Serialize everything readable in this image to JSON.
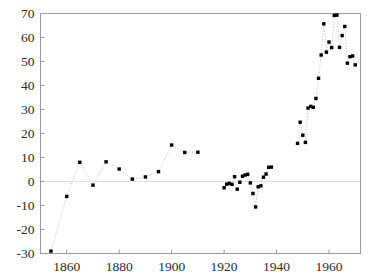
{
  "chart_data": {
    "type": "scatter",
    "title": "",
    "subtitle": "",
    "xlabel": "",
    "ylabel": "",
    "xlim": [
      1850,
      1972
    ],
    "ylim": [
      -30,
      70
    ],
    "xticks": [
      1860,
      1880,
      1900,
      1920,
      1940,
      1960
    ],
    "xtick_labels": [
      "1860",
      "1880",
      "1900",
      "1920",
      "1940",
      "1960"
    ],
    "yticks": [
      -30,
      -20,
      -10,
      0,
      10,
      20,
      30,
      40,
      50,
      60,
      70
    ],
    "ytick_labels": [
      "-30",
      "-20",
      "-10",
      "0",
      "10",
      "20",
      "30",
      "40",
      "50",
      "60",
      "70"
    ],
    "grid": false,
    "zero_line": true,
    "legend": "none",
    "marker": "square",
    "marker_color": "#000000",
    "line_color": "#b9b9b9",
    "line_style": "dotted",
    "frame_color": "#9a9a9a",
    "background": "#ffffff",
    "segments": [
      {
        "name": "segment-1854-1910",
        "points": [
          [
            1854,
            -29.0
          ],
          [
            1860,
            -6.2
          ],
          [
            1865,
            8.0
          ],
          [
            1870,
            -1.5
          ],
          [
            1875,
            8.2
          ],
          [
            1880,
            5.2
          ],
          [
            1885,
            1.0
          ],
          [
            1890,
            1.9
          ],
          [
            1895,
            4.1
          ],
          [
            1900,
            15.2
          ],
          [
            1905,
            12.1
          ],
          [
            1910,
            12.2
          ]
        ]
      },
      {
        "name": "segment-1920-1938",
        "points": [
          [
            1920,
            -2.6
          ],
          [
            1921,
            -1.1
          ],
          [
            1922,
            -0.8
          ],
          [
            1923,
            -1.2
          ],
          [
            1924,
            2.0
          ],
          [
            1925,
            -3.2
          ],
          [
            1926,
            -0.3
          ],
          [
            1927,
            2.2
          ],
          [
            1928,
            2.7
          ],
          [
            1929,
            3.0
          ],
          [
            1930,
            -0.6
          ],
          [
            1931,
            -5.0
          ],
          [
            1932,
            -10.6
          ],
          [
            1933,
            -2.2
          ],
          [
            1934,
            -1.8
          ],
          [
            1935,
            1.8
          ],
          [
            1936,
            3.1
          ],
          [
            1937,
            5.9
          ],
          [
            1938,
            6.0
          ]
        ]
      },
      {
        "name": "segment-1948-1970",
        "points": [
          [
            1948,
            15.9
          ],
          [
            1949,
            24.7
          ],
          [
            1950,
            19.3
          ],
          [
            1951,
            16.3
          ],
          [
            1952,
            30.6
          ],
          [
            1953,
            31.3
          ],
          [
            1954,
            30.9
          ],
          [
            1955,
            34.6
          ],
          [
            1956,
            43.0
          ],
          [
            1957,
            52.7
          ],
          [
            1958,
            65.7
          ],
          [
            1959,
            53.9
          ],
          [
            1960,
            58.1
          ],
          [
            1961,
            55.8
          ],
          [
            1962,
            69.2
          ],
          [
            1963,
            69.3
          ],
          [
            1964,
            55.9
          ],
          [
            1965,
            60.8
          ],
          [
            1966,
            64.6
          ],
          [
            1967,
            49.3
          ],
          [
            1968,
            52.0
          ],
          [
            1969,
            52.3
          ],
          [
            1970,
            48.6
          ]
        ]
      }
    ]
  }
}
